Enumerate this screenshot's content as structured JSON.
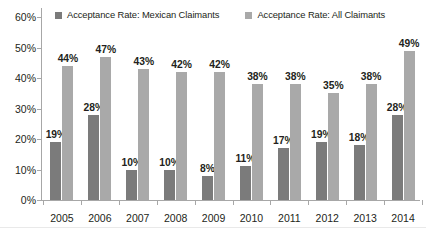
{
  "legend": {
    "entries": [
      {
        "label": "Acceptance Rate: Mexican Claimants",
        "color": "#7b7b7b",
        "key": "mexican"
      },
      {
        "label": "Acceptance Rate: All Claimants",
        "color": "#a9a9a9",
        "key": "all"
      }
    ]
  },
  "axes": {
    "y_ticks": [
      "0%",
      "10%",
      "20%",
      "30%",
      "40%",
      "50%",
      "60%"
    ],
    "y_values": [
      0,
      10,
      20,
      30,
      40,
      50,
      60
    ]
  },
  "chart_data": {
    "type": "bar",
    "title": "",
    "subtitle": "",
    "xlabel": "",
    "ylabel": "",
    "ylim": [
      0,
      60
    ],
    "grid": false,
    "legend_position": "top",
    "categories": [
      "2005",
      "2006",
      "2007",
      "2008",
      "2009",
      "2010",
      "2011",
      "2012",
      "2013",
      "2014"
    ],
    "series": [
      {
        "name": "Acceptance Rate: Mexican Claimants",
        "color": "#7b7b7b",
        "values": [
          19,
          28,
          10,
          10,
          8,
          11,
          17,
          19,
          18,
          28
        ],
        "labels": [
          "19%",
          "28%",
          "10%",
          "10%",
          "8%",
          "11%",
          "17%",
          "19%",
          "18%",
          "28%"
        ]
      },
      {
        "name": "Acceptance Rate: All Claimants",
        "color": "#a9a9a9",
        "values": [
          44,
          47,
          43,
          42,
          42,
          38,
          38,
          35,
          38,
          49
        ],
        "labels": [
          "44%",
          "47%",
          "43%",
          "42%",
          "42%",
          "38%",
          "38%",
          "35%",
          "38%",
          "49%"
        ]
      }
    ]
  }
}
